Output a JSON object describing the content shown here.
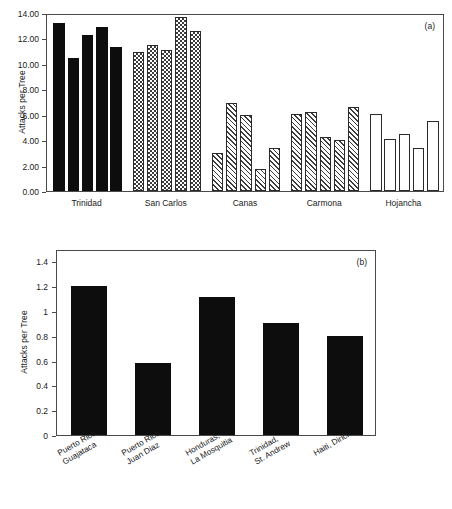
{
  "figure": {
    "panel_a_tag": "(a)",
    "panel_b_tag": "(b)",
    "y_axis_label": "Attacks per Tree"
  },
  "chart_data": [
    {
      "type": "bar",
      "panel": "(a)",
      "title": "",
      "xlabel": "",
      "ylabel": "Attacks per Tree",
      "ylim": [
        0,
        14
      ],
      "ytick_labels": [
        "0.00",
        "2.00",
        "4.00",
        "6.00",
        "8.00",
        "10.00",
        "12.00",
        "14.00"
      ],
      "ytick_values": [
        0,
        2,
        4,
        6,
        8,
        10,
        12,
        14
      ],
      "grid": false,
      "legend": "none",
      "group_labels": [
        "Trinidad",
        "San Carlos",
        "Canas",
        "Carmona",
        "Hojancha"
      ],
      "groups": [
        {
          "name": "Trinidad",
          "fill": "solid",
          "values": [
            13.2,
            10.5,
            12.3,
            12.9,
            11.3
          ]
        },
        {
          "name": "San Carlos",
          "fill": "checker",
          "values": [
            10.9,
            11.5,
            11.1,
            13.7,
            12.6
          ]
        },
        {
          "name": "Canas",
          "fill": "hatch",
          "values": [
            3.0,
            6.95,
            5.95,
            1.7,
            3.4
          ]
        },
        {
          "name": "Carmona",
          "fill": "hatch",
          "values": [
            6.05,
            6.25,
            4.25,
            4.0,
            6.6
          ]
        },
        {
          "name": "Hojancha",
          "fill": "open",
          "values": [
            6.05,
            4.1,
            4.45,
            3.35,
            5.5
          ]
        }
      ],
      "categories": [
        "Trinidad 1",
        "Trinidad 2",
        "Trinidad 3",
        "Trinidad 4",
        "Trinidad 5",
        "San Carlos 1",
        "San Carlos 2",
        "San Carlos 3",
        "San Carlos 4",
        "San Carlos 5",
        "Canas 1",
        "Canas 2",
        "Canas 3",
        "Canas 4",
        "Canas 5",
        "Carmona 1",
        "Carmona 2",
        "Carmona 3",
        "Carmona 4",
        "Carmona 5",
        "Hojancha 1",
        "Hojancha 2",
        "Hojancha 3",
        "Hojancha 4",
        "Hojancha 5"
      ],
      "values": [
        13.2,
        10.5,
        12.3,
        12.9,
        11.3,
        10.9,
        11.5,
        11.1,
        13.7,
        12.6,
        3.0,
        6.95,
        5.95,
        1.7,
        3.4,
        6.05,
        6.25,
        4.25,
        4.0,
        6.6,
        6.05,
        4.1,
        4.45,
        3.35,
        5.5
      ]
    },
    {
      "type": "bar",
      "panel": "(b)",
      "title": "",
      "xlabel": "",
      "ylabel": "Attacks per Tree",
      "ylim": [
        0,
        1.5
      ],
      "ytick_labels": [
        "0",
        "0.2",
        "0.4",
        "0.6",
        "0.8",
        "1",
        "1.2",
        "1.4"
      ],
      "ytick_values": [
        0,
        0.2,
        0.4,
        0.6,
        0.8,
        1.0,
        1.2,
        1.4
      ],
      "grid": false,
      "legend": "none",
      "categories": [
        "Puerto Rico,\nGuajataca",
        "Puerto Rico,\nJuan Diaz",
        "Honduras,\nLa Mosquitia",
        "Trinidad,\nSt. Andrew",
        "Haiti, Dirici"
      ],
      "values": [
        1.2,
        0.58,
        1.11,
        0.9,
        0.8
      ],
      "fill": "solid"
    }
  ],
  "colors": {
    "bar_solid": "#0d0d0d",
    "bar_pattern": "#3c3c3c",
    "axis": "#4a4a4a",
    "text": "#1a1a1a",
    "background": "#ffffff"
  }
}
